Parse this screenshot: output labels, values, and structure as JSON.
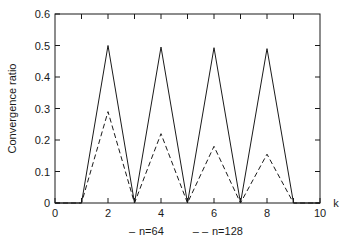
{
  "chart_data": {
    "type": "line",
    "title": "",
    "xlabel": "k",
    "ylabel": "Convergence ratio",
    "xlim": [
      0,
      10
    ],
    "ylim": [
      0,
      0.6
    ],
    "grid": false,
    "legend_position": "below-axes",
    "xticks": [
      0,
      1,
      2,
      3,
      4,
      5,
      6,
      7,
      8,
      9,
      10
    ],
    "xtick_labels": [
      "0",
      "",
      "2",
      "",
      "4",
      "",
      "6",
      "",
      "8",
      "",
      "10"
    ],
    "yticks": [
      0,
      0.1,
      0.2,
      0.3,
      0.4,
      0.5,
      0.6
    ],
    "ytick_labels": [
      "0",
      "0.1",
      "0.2",
      "0.3",
      "0.4",
      "0.5",
      "0.6"
    ],
    "series": [
      {
        "name": "n=64",
        "style": "solid",
        "legend_label": "n=64",
        "legend_dash": "–",
        "x": [
          0,
          1,
          2,
          3,
          4,
          5,
          6,
          7,
          8,
          9,
          10
        ],
        "values": [
          0,
          0,
          0.5,
          0,
          0.495,
          0,
          0.493,
          0,
          0.49,
          0,
          0
        ]
      },
      {
        "name": "n=128",
        "style": "dashed",
        "legend_label": "n=128",
        "legend_dash": "– –",
        "x": [
          0,
          1,
          2,
          3,
          4,
          5,
          6,
          7,
          8,
          9,
          10
        ],
        "values": [
          0,
          0,
          0.29,
          0,
          0.22,
          0,
          0.18,
          0,
          0.155,
          0,
          0
        ]
      }
    ]
  },
  "axes": {
    "ylabel": "Convergence ratio",
    "xlabel": "k",
    "ytick_0": "0",
    "ytick_1": "0.1",
    "ytick_2": "0.2",
    "ytick_3": "0.3",
    "ytick_4": "0.4",
    "ytick_5": "0.5",
    "ytick_6": "0.6",
    "xtick_0": "0",
    "xtick_2": "2",
    "xtick_4": "4",
    "xtick_6": "6",
    "xtick_8": "8",
    "xtick_10": "10"
  },
  "legend": {
    "entry1_dash": "–",
    "entry1_label": "n=64",
    "entry2_dash": "– –",
    "entry2_label": "n=128"
  },
  "colors": {
    "line": "#1a1a1a",
    "axis": "#1a1a1a",
    "background": "#ffffff"
  }
}
